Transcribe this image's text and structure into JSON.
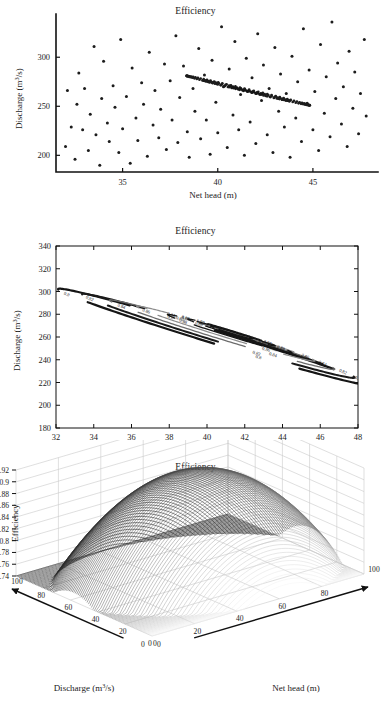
{
  "figure": {
    "panel_count": 3,
    "background": "#ffffff",
    "ink": "#1a1a1a"
  },
  "panels": {
    "scatter": {
      "title": "Efficiency",
      "xlabel": "Net head (m)",
      "ylabel": "Discharge (m³/s)",
      "xticks": [
        "35",
        "40",
        "45"
      ],
      "yticks": [
        "200",
        "250",
        "300"
      ]
    },
    "contour": {
      "title": "Efficiency",
      "xlabel": "Net head (m)",
      "ylabel": "Discharge (m³/s)",
      "xticks": [
        "32",
        "34",
        "36",
        "38",
        "40",
        "42",
        "44",
        "46",
        "48"
      ],
      "yticks": [
        "180",
        "200",
        "220",
        "240",
        "260",
        "280",
        "300",
        "320",
        "340"
      ]
    },
    "surface": {
      "title": "Efficiency",
      "xlabel": "Net head (m)",
      "ylabel": "Discharge (m³/s)",
      "zlabel": "Efficiency",
      "zticks": [
        "0.74",
        "0.76",
        "0.78",
        "0.8",
        "0.82",
        "0.84",
        "0.86",
        "0.88",
        "0.9",
        "0.92"
      ],
      "xticks": [
        "0",
        "20",
        "40",
        "60",
        "80",
        "100"
      ],
      "yticks": [
        "0",
        "20",
        "40",
        "60",
        "80",
        "100"
      ]
    }
  },
  "chart_data": [
    {
      "type": "scatter",
      "title": "Efficiency",
      "xlabel": "Net head (m)",
      "ylabel": "Discharge (m³/s)",
      "xlim": [
        31.5,
        48.0
      ],
      "ylim": [
        183,
        340
      ],
      "xticks": [
        35,
        40,
        45
      ],
      "yticks": [
        200,
        250,
        300
      ],
      "grid": false,
      "legend": "none",
      "notes": "Randomly scattered sample points with three concentric dotted ellipses (iso-efficiency rings) tilted ~25 degrees, centred near net head 41.5 m, discharge 265 m3/s.",
      "points": [
        [
          32.0,
          209
        ],
        [
          32.1,
          266
        ],
        [
          32.3,
          229
        ],
        [
          32.5,
          196
        ],
        [
          32.6,
          252
        ],
        [
          32.7,
          284
        ],
        [
          32.9,
          226
        ],
        [
          33.0,
          268
        ],
        [
          33.2,
          205
        ],
        [
          33.3,
          242
        ],
        [
          33.5,
          311
        ],
        [
          33.6,
          221
        ],
        [
          33.8,
          190
        ],
        [
          33.9,
          258
        ],
        [
          34.0,
          296
        ],
        [
          34.2,
          233
        ],
        [
          34.3,
          214
        ],
        [
          34.5,
          271
        ],
        [
          34.6,
          249
        ],
        [
          34.8,
          203
        ],
        [
          34.9,
          318
        ],
        [
          35.0,
          227
        ],
        [
          35.2,
          260
        ],
        [
          35.4,
          192
        ],
        [
          35.5,
          289
        ],
        [
          35.7,
          238
        ],
        [
          35.8,
          215
        ],
        [
          36.0,
          274
        ],
        [
          36.1,
          252
        ],
        [
          36.3,
          199
        ],
        [
          36.4,
          305
        ],
        [
          36.6,
          231
        ],
        [
          36.7,
          266
        ],
        [
          36.9,
          218
        ],
        [
          37.0,
          247
        ],
        [
          37.2,
          293
        ],
        [
          37.3,
          206
        ],
        [
          37.5,
          276
        ],
        [
          37.6,
          236
        ],
        [
          37.8,
          322
        ],
        [
          37.9,
          213
        ],
        [
          38.0,
          259
        ],
        [
          38.2,
          291
        ],
        [
          38.4,
          224
        ],
        [
          38.5,
          198
        ],
        [
          38.7,
          268
        ],
        [
          38.8,
          245
        ],
        [
          39.0,
          309
        ],
        [
          39.1,
          217
        ],
        [
          39.3,
          282
        ],
        [
          39.4,
          236
        ],
        [
          39.6,
          201
        ],
        [
          39.7,
          297
        ],
        [
          39.9,
          254
        ],
        [
          40.0,
          223
        ],
        [
          40.2,
          331
        ],
        [
          40.3,
          270
        ],
        [
          40.5,
          208
        ],
        [
          40.6,
          288
        ],
        [
          40.8,
          241
        ],
        [
          40.9,
          316
        ],
        [
          41.1,
          226
        ],
        [
          41.2,
          262
        ],
        [
          41.4,
          200
        ],
        [
          41.5,
          299
        ],
        [
          41.7,
          234
        ],
        [
          41.8,
          279
        ],
        [
          42.0,
          212
        ],
        [
          42.1,
          324
        ],
        [
          42.3,
          256
        ],
        [
          42.4,
          292
        ],
        [
          42.6,
          221
        ],
        [
          42.7,
          268
        ],
        [
          42.9,
          203
        ],
        [
          43.0,
          310
        ],
        [
          43.2,
          245
        ],
        [
          43.3,
          283
        ],
        [
          43.5,
          229
        ],
        [
          43.6,
          263
        ],
        [
          43.8,
          198
        ],
        [
          43.9,
          301
        ],
        [
          44.1,
          238
        ],
        [
          44.2,
          275
        ],
        [
          44.4,
          214
        ],
        [
          44.5,
          329
        ],
        [
          44.7,
          253
        ],
        [
          44.8,
          287
        ],
        [
          45.0,
          226
        ],
        [
          45.1,
          265
        ],
        [
          45.3,
          205
        ],
        [
          45.4,
          313
        ],
        [
          45.6,
          243
        ],
        [
          45.7,
          280
        ],
        [
          45.9,
          219
        ],
        [
          46.0,
          336
        ],
        [
          46.2,
          258
        ],
        [
          46.3,
          294
        ],
        [
          46.5,
          232
        ],
        [
          46.6,
          270
        ],
        [
          46.8,
          209
        ],
        [
          46.9,
          306
        ],
        [
          47.1,
          248
        ],
        [
          47.2,
          285
        ],
        [
          47.4,
          222
        ],
        [
          47.5,
          263
        ],
        [
          47.7,
          318
        ],
        [
          47.8,
          240
        ]
      ],
      "ellipses": [
        {
          "cx": 41.6,
          "cy": 266,
          "rx": 3.6,
          "ry": 1.05,
          "angle_deg": -26,
          "level": 0.82,
          "style": "dotted"
        },
        {
          "cx": 41.5,
          "cy": 266,
          "rx": 2.5,
          "ry": 0.78,
          "angle_deg": -26,
          "level": 0.86,
          "style": "dotted"
        },
        {
          "cx": 41.5,
          "cy": 266,
          "rx": 0.95,
          "ry": 0.42,
          "angle_deg": -26,
          "level": 0.9,
          "style": "solid"
        }
      ]
    },
    {
      "type": "contour",
      "title": "Efficiency",
      "xlabel": "Net head (m)",
      "ylabel": "Discharge (m³/s)",
      "xlim": [
        32,
        48
      ],
      "ylim": [
        180,
        340
      ],
      "xticks": [
        32,
        34,
        36,
        38,
        40,
        42,
        44,
        46,
        48
      ],
      "yticks": [
        180,
        200,
        220,
        240,
        260,
        280,
        300,
        320,
        340
      ],
      "grid": false,
      "legend": "inline-contour-labels",
      "levels": [
        0.8,
        0.82,
        0.84,
        0.86,
        0.88,
        0.89,
        0.9
      ],
      "level_labels": [
        "0.8",
        "0.82",
        "0.84",
        "0.86",
        "0.88",
        "0.89",
        "0.9"
      ],
      "peak": {
        "x": 41.3,
        "y": 264,
        "value": 0.905
      },
      "notes": "Nested tilted elliptical iso-efficiency contours; outer rings 0.8 and 0.82 are thick black, 0.84/0.86 medium grey, 0.88/0.89/0.9 thin black; labels inserted in-line along each contour.",
      "contours": [
        {
          "level": 0.8,
          "cx": 40.4,
          "cy": 260,
          "rx": 9.3,
          "ry": 5.3,
          "angle_deg": -27,
          "width": 2.2,
          "color": "#151515"
        },
        {
          "level": 0.82,
          "cx": 40.6,
          "cy": 261,
          "rx": 8.1,
          "ry": 4.6,
          "angle_deg": -27,
          "width": 2.0,
          "color": "#1a1a1a"
        },
        {
          "level": 0.84,
          "cx": 40.8,
          "cy": 262,
          "rx": 6.7,
          "ry": 3.8,
          "angle_deg": -27,
          "width": 1.3,
          "color": "#6d6d6d"
        },
        {
          "level": 0.86,
          "cx": 41.0,
          "cy": 263,
          "rx": 5.3,
          "ry": 3.0,
          "angle_deg": -27,
          "width": 1.2,
          "color": "#8c8c8c"
        },
        {
          "level": 0.88,
          "cx": 41.2,
          "cy": 263,
          "rx": 3.7,
          "ry": 2.1,
          "angle_deg": -27,
          "width": 1.3,
          "color": "#151515"
        },
        {
          "level": 0.89,
          "cx": 41.3,
          "cy": 264,
          "rx": 2.6,
          "ry": 1.45,
          "angle_deg": -27,
          "width": 1.3,
          "color": "#151515"
        },
        {
          "level": 0.9,
          "cx": 41.3,
          "cy": 264,
          "rx": 1.25,
          "ry": 0.72,
          "angle_deg": -27,
          "width": 1.2,
          "color": "#151515"
        }
      ]
    },
    {
      "type": "surface",
      "title": "Efficiency",
      "xlabel": "Net head (m)",
      "ylabel": "Discharge (m³/s)",
      "zlabel": "Efficiency",
      "xlim": [
        0,
        100
      ],
      "ylim": [
        0,
        100
      ],
      "zlim": [
        0.74,
        0.92
      ],
      "xticks": [
        0,
        20,
        40,
        60,
        80,
        100
      ],
      "yticks": [
        0,
        20,
        40,
        60,
        80,
        100
      ],
      "zticks": [
        0.74,
        0.76,
        0.78,
        0.8,
        0.82,
        0.84,
        0.86,
        0.88,
        0.9,
        0.92
      ],
      "grid": true,
      "legend": "none",
      "colormap": "grayscale",
      "peak": {
        "x": 52,
        "y": 48,
        "z": 0.915
      },
      "notes": "Dome / paraboloid efficiency response surface drawn as dense mesh lines over a 3-D box with grey grid walls; arrows on both base axes point outward from the origin corner."
    }
  ]
}
